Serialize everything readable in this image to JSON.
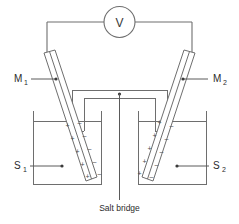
{
  "diagram": {
    "caption": "Salt bridge",
    "meter": {
      "label": "V",
      "name": "voltmeter"
    },
    "labels": {
      "electrode_left": "M",
      "electrode_left_sub": "1",
      "electrode_right": "M",
      "electrode_right_sub": "2",
      "solution_left": "S",
      "solution_left_sub": "1",
      "solution_right": "S",
      "solution_right_sub": "2"
    },
    "charges": {
      "positive": "+",
      "negative": "–",
      "left_electrode_pairs": 5,
      "right_electrode_pairs": 5,
      "left_inside_sign": "+",
      "left_outside_sign": "–",
      "right_inside_sign": "–",
      "right_outside_sign": "+"
    },
    "colors": {
      "background": "#ffffff",
      "line": "#6e6e6e",
      "text": "#2b2b2b"
    }
  }
}
